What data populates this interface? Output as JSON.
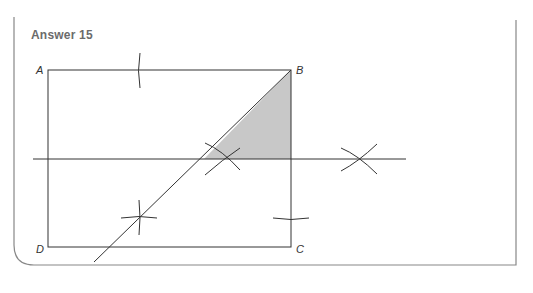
{
  "title": "Answer 15",
  "points": {
    "A": {
      "label": "A",
      "x": 48,
      "y": 70
    },
    "B": {
      "label": "B",
      "x": 291,
      "y": 70
    },
    "C": {
      "label": "C",
      "x": 291,
      "y": 247
    },
    "D": {
      "label": "D",
      "x": 48,
      "y": 247
    }
  },
  "colors": {
    "line": "#333333",
    "shade": "#c8c8c8",
    "frame": "#888888",
    "title": "#6b6b6b"
  },
  "shaded_region": "triangle bounded by B, diagonal and horizontal bisector"
}
